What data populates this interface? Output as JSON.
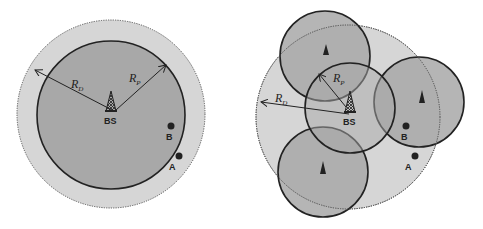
{
  "colors": {
    "background": "#ffffff",
    "outer_region": "#d6d6d6",
    "inner_region": "#a8a8a8",
    "stroke": "#222222"
  },
  "left_diagram": {
    "title": "Single base station coverage",
    "bs_label": "BS",
    "rd_label": "R",
    "rd_sub": "D",
    "rp_label": "R",
    "rp_sub": "P",
    "user_a_label": "A",
    "user_b_label": "B"
  },
  "right_diagram": {
    "title": "Base station with relay cells",
    "bs_label": "BS",
    "rd_label": "R",
    "rd_sub": "D",
    "rp_label": "R",
    "rp_sub": "P",
    "user_a_label": "A",
    "user_b_label": "B"
  }
}
